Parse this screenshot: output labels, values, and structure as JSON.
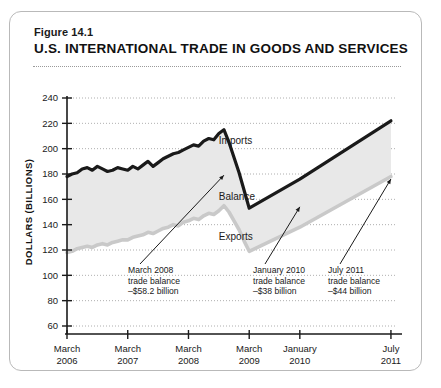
{
  "figure": {
    "number": "Figure 14.1",
    "title": "U.S. INTERNATIONAL TRADE IN GOODS AND SERVICES"
  },
  "chart_data": {
    "type": "area",
    "title": "U.S. INTERNATIONAL TRADE IN GOODS AND SERVICES",
    "xlabel": "",
    "ylabel": "DOLLARS (BILLIONS)",
    "ylim": [
      60,
      240
    ],
    "ytick_step": 20,
    "yticks": [
      60,
      80,
      100,
      120,
      140,
      160,
      180,
      200,
      220,
      240
    ],
    "grid": true,
    "xticks": [
      {
        "line1": "March",
        "line2": "2006",
        "x": 0
      },
      {
        "line1": "March",
        "line2": "2007",
        "x": 12
      },
      {
        "line1": "March",
        "line2": "2008",
        "x": 24
      },
      {
        "line1": "March",
        "line2": "2009",
        "x": 36
      },
      {
        "line1": "January",
        "line2": "2010",
        "x": 46
      },
      {
        "line1": "July",
        "line2": "2011",
        "x": 64
      }
    ],
    "xlim": [
      0,
      65
    ],
    "legend_position": "inline-labels",
    "series": [
      {
        "name": "Imports",
        "color": "#1a1a1a",
        "x": [
          0,
          1,
          2,
          3,
          4,
          5,
          6,
          7,
          8,
          9,
          10,
          11,
          12,
          13,
          14,
          15,
          16,
          17,
          18,
          19,
          20,
          21,
          22,
          23,
          24,
          25,
          26,
          27,
          28,
          29,
          30,
          31,
          32,
          33,
          34,
          35,
          36,
          46,
          64
        ],
        "values": [
          178,
          180,
          181,
          184,
          185,
          183,
          186,
          184,
          182,
          183,
          185,
          184,
          183,
          186,
          184,
          187,
          190,
          186,
          189,
          192,
          194,
          196,
          197,
          199,
          201,
          203,
          202,
          206,
          208,
          207,
          212,
          215,
          205,
          193,
          181,
          167,
          153,
          176,
          222
        ]
      },
      {
        "name": "Exports",
        "color": "#c9c9c9",
        "x": [
          0,
          1,
          2,
          3,
          4,
          5,
          6,
          7,
          8,
          9,
          10,
          11,
          12,
          13,
          14,
          15,
          16,
          17,
          18,
          19,
          20,
          21,
          22,
          23,
          24,
          25,
          26,
          27,
          28,
          29,
          30,
          31,
          32,
          33,
          34,
          35,
          36,
          46,
          64
        ],
        "values": [
          118,
          119,
          121,
          122,
          123,
          122,
          124,
          125,
          124,
          126,
          127,
          128,
          128,
          130,
          131,
          132,
          134,
          133,
          135,
          137,
          138,
          140,
          139,
          142,
          143,
          145,
          144,
          147,
          149,
          148,
          151,
          155,
          150,
          143,
          136,
          127,
          119,
          138,
          178
        ]
      },
      {
        "name": "Balance",
        "color": "#e8e8e8",
        "description": "shaded area between Imports and Exports"
      }
    ],
    "series_labels": [
      {
        "text": "Imports",
        "x": 30,
        "y": 206
      },
      {
        "text": "Balance",
        "x": 30,
        "y": 162
      },
      {
        "text": "Exports",
        "x": 30,
        "y": 130
      }
    ],
    "annotations": [
      {
        "lines": [
          "March 2008",
          "trade balance",
          "–$58.2 billion"
        ],
        "point_x": 31,
        "point_y": 183,
        "value": -58.2,
        "period": "March 2008"
      },
      {
        "lines": [
          "January 2010",
          "trade balance",
          "–$38 billion"
        ],
        "point_x": 46,
        "point_y": 158,
        "value": -38,
        "period": "January 2010"
      },
      {
        "lines": [
          "July 2011",
          "trade balance",
          "–$44 billion"
        ],
        "point_x": 64,
        "point_y": 180,
        "value": -44,
        "period": "July 2011"
      }
    ]
  }
}
